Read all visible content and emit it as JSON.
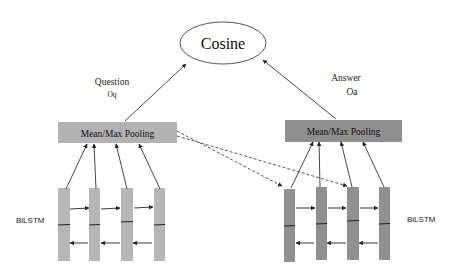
{
  "diagram": {
    "top_node": {
      "label": "Cosine"
    },
    "question": {
      "label": "Question",
      "sub_label": "Oq",
      "pooling_label": "Mean/Max Pooling",
      "lstm_label": "BiLSTM",
      "box_color": "#b3b3b3",
      "column_color": "#b7b7b7"
    },
    "answer": {
      "label": "Answer",
      "sub_label": "Oa",
      "pooling_label": "Mean/Max Pooling",
      "lstm_label": "BiLSTM",
      "box_color": "#8f8f8f",
      "column_color": "#909090"
    },
    "edges": [
      {
        "from": "question-pooling",
        "to": "cosine",
        "style": "solid"
      },
      {
        "from": "answer-pooling",
        "to": "cosine",
        "style": "solid"
      },
      {
        "from": "question-pooling",
        "to": "answer-lstm-cell-1",
        "style": "dashed"
      },
      {
        "from": "question-pooling",
        "to": "answer-lstm-cell-3",
        "style": "dashed"
      }
    ]
  }
}
